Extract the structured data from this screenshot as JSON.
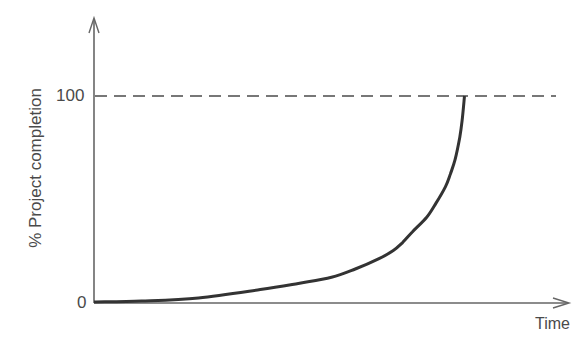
{
  "chart_data": {
    "type": "line",
    "title": "",
    "xlabel": "Time",
    "ylabel": "% Project completion",
    "yticks": [
      0,
      100
    ],
    "ytick_labels": [
      "0",
      "100"
    ],
    "xticks": [],
    "ylim": [
      0,
      135
    ],
    "xlim": [
      0,
      100
    ],
    "grid": false,
    "legend": null,
    "reference_lines": [
      {
        "orientation": "horizontal",
        "y": 100,
        "style": "dashed",
        "color": "#777777"
      }
    ],
    "series": [
      {
        "name": "Project completion",
        "color": "#333333",
        "x": [
          0,
          10,
          22,
          35,
          43,
          50,
          55,
          60,
          63,
          65,
          67,
          70,
          72,
          74,
          75,
          76,
          77,
          77.5,
          78
        ],
        "y": [
          0,
          0.5,
          2,
          6,
          9,
          12,
          16,
          21,
          25,
          29,
          34,
          41,
          48,
          56,
          62,
          69,
          80,
          88,
          100
        ]
      }
    ],
    "annotations": []
  },
  "labels": {
    "y_axis_title": "% Project completion",
    "x_axis_title": "Time",
    "y_tick_0": "0",
    "y_tick_100": "100"
  }
}
